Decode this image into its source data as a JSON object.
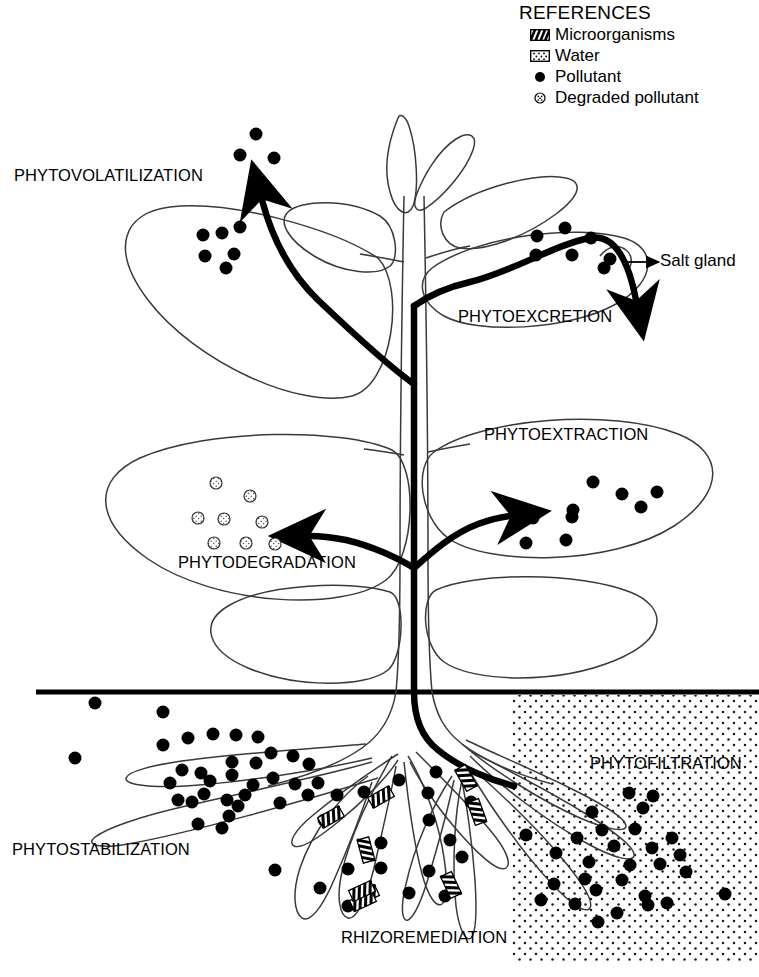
{
  "figure": {
    "kind": "phytoremediation-mechanisms-diagram",
    "background_color": "#ffffff",
    "ink_color": "#000000"
  },
  "legend": {
    "title": "REFERENCES",
    "items": [
      {
        "icon": "microorganism-icon",
        "label": "Microorganisms"
      },
      {
        "icon": "water-icon",
        "label": "Water"
      },
      {
        "icon": "pollutant-icon",
        "label": "Pollutant"
      },
      {
        "icon": "degraded-pollutant-icon",
        "label": "Degraded pollutant"
      }
    ]
  },
  "labels": {
    "phytovolatilization": "PHYTOVOLATILIZATION",
    "phytoexcretion": "PHYTOEXCRETION",
    "salt_gland": "Salt gland",
    "phytoextraction": "PHYTOEXTRACTION",
    "phytodegradation": "PHYTODEGRADATION",
    "phytostabilization": "PHYTOSTABILIZATION",
    "rhizoremediation": "RHIZOREMEDIATION",
    "phytofiltration": "PHYTOFILTRATION"
  }
}
